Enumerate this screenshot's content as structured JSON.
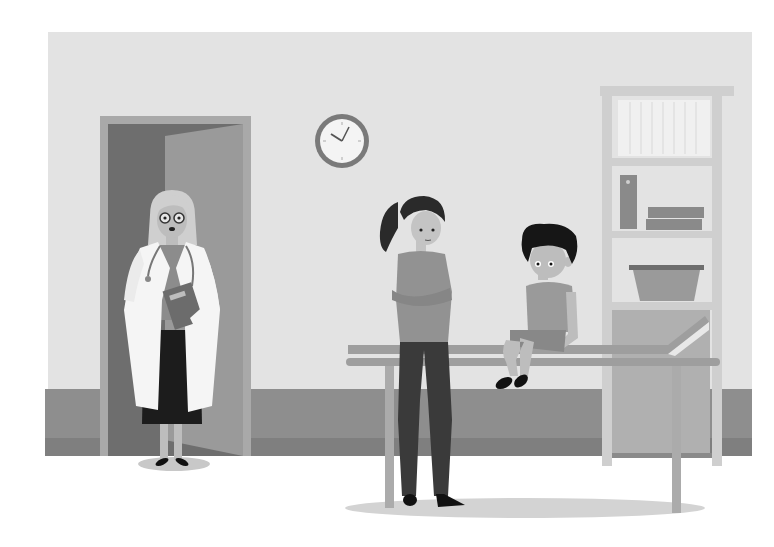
{
  "scene": {
    "description": "Grayscale flat illustration of a doctor's examination room: a female doctor in a white coat stands in a doorway holding a clipboard, a mother with crossed arms stands beside an examination table where a worried boy sits, a wall clock and a shelving cabinet in the background.",
    "width": 774,
    "height": 547
  },
  "colors": {
    "background": "#ffffff",
    "wall": "#e3e3e3",
    "baseboard": "#8e8e8e",
    "baseboard_dark": "#7f7f7f",
    "door_frame": "#a9a9a9",
    "door_opening": "#6e6e6e",
    "door_panel": "#9a9a9a",
    "shadow": "#c8c8c8",
    "clock_rim": "#7a7a7a",
    "clock_face": "#f4f4f4",
    "clock_hands": "#555555",
    "shelf_frame": "#cfcfcf",
    "shelf_inner": "#dedede",
    "shelf_books": "#f0f0f0",
    "shelf_items": "#8a8a8a",
    "cabinet": "#b0b0b0",
    "table_top": "#9e9e9e",
    "table_leg": "#ababab",
    "coat": "#f5f5f5",
    "coat_line": "#c4c4c4",
    "skirt": "#1c1c1c",
    "doctor_shirt": "#8c8c8c",
    "doctor_hair": "#cfcfcf",
    "skin": "#bdbdbd",
    "clipboard": "#6c6c6c",
    "mother_hair": "#2a2a2a",
    "mother_shirt": "#929292",
    "mother_pants": "#3a3a3a",
    "boy_hair": "#161616",
    "boy_shirt": "#9a9a9a",
    "boy_shorts": "#888888",
    "shoes": "#111111"
  },
  "clock": {
    "cx": 342,
    "cy": 141,
    "r": 26,
    "hour_hand_angle": -60,
    "minute_hand_angle": 30
  },
  "characters": [
    {
      "name": "doctor",
      "role": "female doctor with glasses, white coat, stethoscope, holding clipboard"
    },
    {
      "name": "mother",
      "role": "woman with ponytail, arms crossed"
    },
    {
      "name": "boy",
      "role": "boy sitting on examination table, worried expression"
    }
  ]
}
